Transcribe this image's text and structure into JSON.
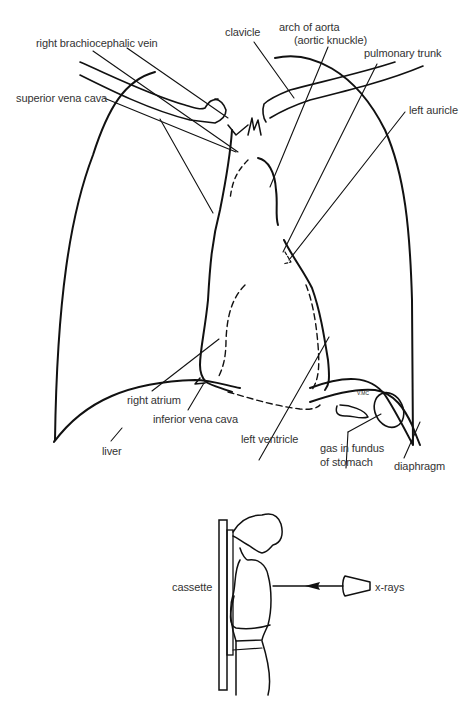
{
  "figure": {
    "diagram_labels": {
      "right_brachiocephalic_vein": "right brachiocephalic vein",
      "superior_vena_cava": "superior vena cava",
      "clavicle": "clavicle",
      "arch_of_aorta_line1": "arch of aorta",
      "arch_of_aorta_line2": "(aortic knuckle)",
      "pulmonary_trunk": "pulmonary trunk",
      "left_auricle": "left auricle",
      "right_atrium": "right atrium",
      "inferior_vena_cava": "inferior vena cava",
      "liver": "liver",
      "left_ventricle": "left ventricle",
      "gas_in_fundus_line1": "gas in fundus",
      "gas_in_fundus_line2": "of stomach",
      "diaphragm": "diaphragm"
    },
    "positioning_labels": {
      "cassette": "cassette",
      "x_rays": "x-rays"
    }
  }
}
